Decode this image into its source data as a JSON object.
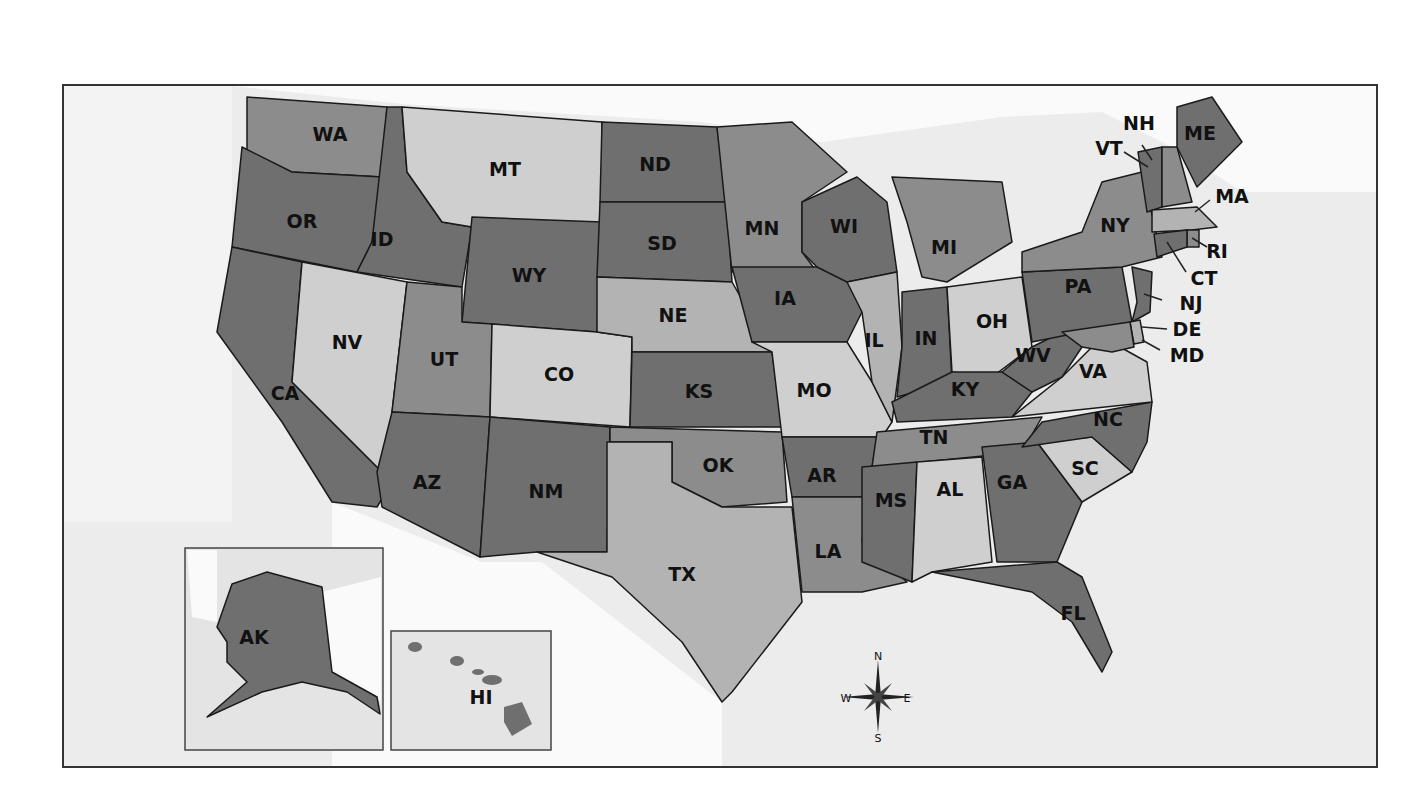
{
  "map": {
    "title": "United States",
    "colors": {
      "dark": "#6f6f6f",
      "medium": "#8c8c8c",
      "light": "#b3b3b3",
      "lightest": "#cfcfcf",
      "water": "#ececec",
      "land_outside": "#fafafa",
      "border": "#1a1a1a"
    },
    "states": [
      {
        "abbr": "WA",
        "shade": "medium"
      },
      {
        "abbr": "OR",
        "shade": "dark"
      },
      {
        "abbr": "CA",
        "shade": "dark"
      },
      {
        "abbr": "ID",
        "shade": "dark"
      },
      {
        "abbr": "NV",
        "shade": "lightest"
      },
      {
        "abbr": "MT",
        "shade": "lightest"
      },
      {
        "abbr": "WY",
        "shade": "dark"
      },
      {
        "abbr": "UT",
        "shade": "medium"
      },
      {
        "abbr": "AZ",
        "shade": "dark"
      },
      {
        "abbr": "CO",
        "shade": "lightest"
      },
      {
        "abbr": "NM",
        "shade": "dark"
      },
      {
        "abbr": "ND",
        "shade": "dark"
      },
      {
        "abbr": "SD",
        "shade": "dark"
      },
      {
        "abbr": "NE",
        "shade": "light"
      },
      {
        "abbr": "KS",
        "shade": "dark"
      },
      {
        "abbr": "OK",
        "shade": "medium"
      },
      {
        "abbr": "TX",
        "shade": "light"
      },
      {
        "abbr": "MN",
        "shade": "medium"
      },
      {
        "abbr": "IA",
        "shade": "dark"
      },
      {
        "abbr": "MO",
        "shade": "lightest"
      },
      {
        "abbr": "AR",
        "shade": "dark"
      },
      {
        "abbr": "LA",
        "shade": "medium"
      },
      {
        "abbr": "WI",
        "shade": "dark"
      },
      {
        "abbr": "IL",
        "shade": "light"
      },
      {
        "abbr": "MI",
        "shade": "medium"
      },
      {
        "abbr": "IN",
        "shade": "dark"
      },
      {
        "abbr": "OH",
        "shade": "lightest"
      },
      {
        "abbr": "KY",
        "shade": "dark"
      },
      {
        "abbr": "TN",
        "shade": "medium"
      },
      {
        "abbr": "MS",
        "shade": "dark"
      },
      {
        "abbr": "AL",
        "shade": "lightest"
      },
      {
        "abbr": "GA",
        "shade": "dark"
      },
      {
        "abbr": "FL",
        "shade": "dark"
      },
      {
        "abbr": "SC",
        "shade": "lightest"
      },
      {
        "abbr": "NC",
        "shade": "dark"
      },
      {
        "abbr": "VA",
        "shade": "lightest"
      },
      {
        "abbr": "WV",
        "shade": "dark"
      },
      {
        "abbr": "PA",
        "shade": "dark"
      },
      {
        "abbr": "NY",
        "shade": "medium"
      },
      {
        "abbr": "VT",
        "shade": "dark"
      },
      {
        "abbr": "NH",
        "shade": "medium"
      },
      {
        "abbr": "ME",
        "shade": "dark"
      },
      {
        "abbr": "MA",
        "shade": "light"
      },
      {
        "abbr": "RI",
        "shade": "medium"
      },
      {
        "abbr": "CT",
        "shade": "dark"
      },
      {
        "abbr": "NJ",
        "shade": "dark"
      },
      {
        "abbr": "DE",
        "shade": "light"
      },
      {
        "abbr": "MD",
        "shade": "medium"
      },
      {
        "abbr": "AK",
        "shade": "dark"
      },
      {
        "abbr": "HI",
        "shade": "medium"
      }
    ],
    "insets": {
      "alaska_label": "AK",
      "hawaii_label": "HI"
    },
    "compass": {
      "n": "N",
      "s": "S",
      "e": "E",
      "w": "W"
    }
  }
}
